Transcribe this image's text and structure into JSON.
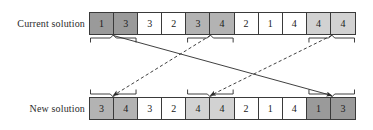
{
  "figure": {
    "type": "diagram",
    "rows": [
      {
        "id": "current",
        "label": "Current solution",
        "cells": [
          {
            "value": "1",
            "shade": "dark"
          },
          {
            "value": "3",
            "shade": "dark"
          },
          {
            "value": "3",
            "shade": "white"
          },
          {
            "value": "2",
            "shade": "white"
          },
          {
            "value": "3",
            "shade": "mid"
          },
          {
            "value": "4",
            "shade": "mid"
          },
          {
            "value": "2",
            "shade": "white"
          },
          {
            "value": "1",
            "shade": "white"
          },
          {
            "value": "4",
            "shade": "white"
          },
          {
            "value": "4",
            "shade": "light"
          },
          {
            "value": "4",
            "shade": "light"
          }
        ],
        "braces": [
          {
            "id": "top-brace-1",
            "from_cell": 1,
            "to_cell": 2
          },
          {
            "id": "top-brace-2",
            "from_cell": 5,
            "to_cell": 6
          },
          {
            "id": "top-brace-3",
            "from_cell": 10,
            "to_cell": 11
          }
        ]
      },
      {
        "id": "new",
        "label": "New solution",
        "cells": [
          {
            "value": "3",
            "shade": "mid"
          },
          {
            "value": "4",
            "shade": "mid"
          },
          {
            "value": "3",
            "shade": "white"
          },
          {
            "value": "2",
            "shade": "white"
          },
          {
            "value": "4",
            "shade": "light"
          },
          {
            "value": "4",
            "shade": "light"
          },
          {
            "value": "2",
            "shade": "white"
          },
          {
            "value": "1",
            "shade": "white"
          },
          {
            "value": "4",
            "shade": "white"
          },
          {
            "value": "1",
            "shade": "dark"
          },
          {
            "value": "3",
            "shade": "dark"
          }
        ],
        "braces": [
          {
            "id": "bottom-brace-1",
            "from_cell": 1,
            "to_cell": 2
          },
          {
            "id": "bottom-brace-2",
            "from_cell": 5,
            "to_cell": 6
          },
          {
            "id": "bottom-brace-3",
            "from_cell": 10,
            "to_cell": 11
          }
        ]
      }
    ],
    "arrows": [
      {
        "id": "arrow-block1-to-block3",
        "style": "solid",
        "source": "top-brace-1",
        "target": "bottom-brace-3"
      },
      {
        "id": "arrow-block2-to-block1",
        "style": "dashed",
        "source": "top-brace-2",
        "target": "bottom-brace-1"
      },
      {
        "id": "arrow-block3-to-block2",
        "style": "dashed",
        "source": "top-brace-3",
        "target": "bottom-brace-2"
      }
    ],
    "colors": {
      "white": "#ffffff",
      "light": "#d2d2d2",
      "mid": "#b3b3b3",
      "dark": "#9a9a9a",
      "stroke": "#3a3a3a",
      "text": "#1a1a1a",
      "label_text": "#2b2b2b"
    }
  }
}
